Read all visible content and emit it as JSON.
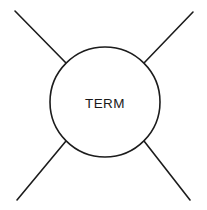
{
  "canvas": {
    "width": 207,
    "height": 210,
    "background_color": "#ffffff"
  },
  "diagram": {
    "type": "node-with-four-edges",
    "stroke_color": "#1c1c1c",
    "stroke_width": 1.6,
    "node": {
      "label": "TERM",
      "shape": "circle",
      "center_x": 105,
      "center_y": 102,
      "radius": 55,
      "fill_color": "#ffffff",
      "label_x": 105,
      "label_y": 104,
      "label_color": "#1a1a1a",
      "label_font_size": 13.5
    },
    "edges": [
      {
        "name": "edge-top-left",
        "x1": 15,
        "y1": 11,
        "x2": 66,
        "y2": 63
      },
      {
        "name": "edge-top-right",
        "x1": 193,
        "y1": 12,
        "x2": 144,
        "y2": 63
      },
      {
        "name": "edge-bottom-left",
        "x1": 17,
        "y1": 200,
        "x2": 66,
        "y2": 141
      },
      {
        "name": "edge-bottom-right",
        "x1": 190,
        "y1": 200,
        "x2": 144,
        "y2": 141
      }
    ]
  }
}
